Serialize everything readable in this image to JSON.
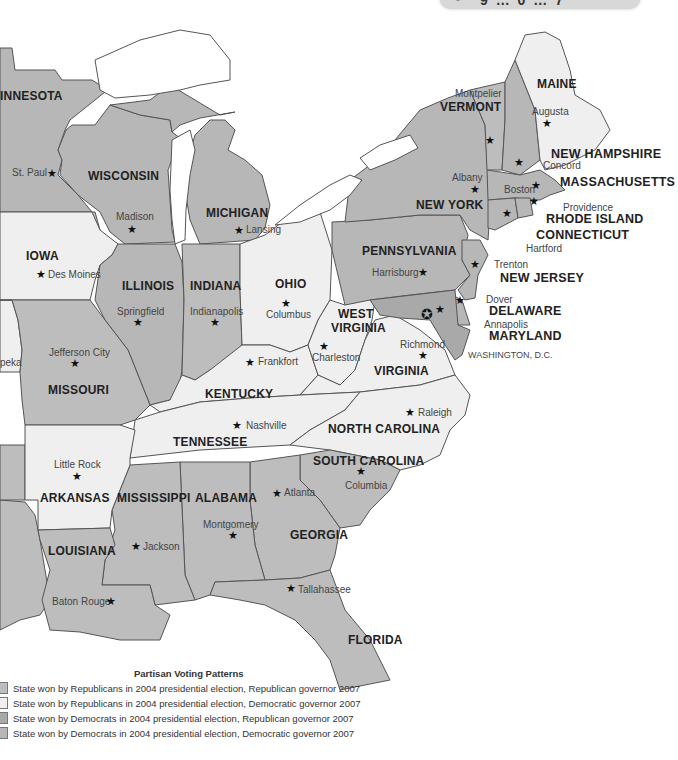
{
  "top_bar": {
    "text": "9 … 0 … 7",
    "icon": "pencil-icon"
  },
  "legend": {
    "title": "Partisan Voting Patterns",
    "items": [
      {
        "key": "rr",
        "color": "#bdbdbd",
        "label": "State won by Republicans in 2004 presidential election, Republican governor 2007"
      },
      {
        "key": "rd",
        "color": "#efefef",
        "label": "State won by Republicans in 2004 presidential election, Democratic governor 2007"
      },
      {
        "key": "dr",
        "color": "#a9a9a9",
        "label": "State won by Democrats in 2004 presidential election, Republican governor 2007"
      },
      {
        "key": "dd",
        "color": "#b7b7b7",
        "label": "State won by Democrats in 2004 presidential election, Democratic governor 2007"
      }
    ]
  },
  "states": {
    "minnesota": {
      "name": "INNESOTA",
      "capital": "St. Paul"
    },
    "wisconsin": {
      "name": "WISCONSIN",
      "capital": "Madison"
    },
    "michigan": {
      "name": "MICHIGAN",
      "capital": "Lansing"
    },
    "iowa": {
      "name": "IOWA",
      "capital": "Des Moines"
    },
    "illinois": {
      "name": "ILLINOIS",
      "capital": "Springfield"
    },
    "indiana": {
      "name": "INDIANA",
      "capital": "Indianapolis"
    },
    "ohio": {
      "name": "OHIO",
      "capital": "Columbus"
    },
    "kansas": {
      "capital": "peka"
    },
    "missouri": {
      "name": "MISSOURI",
      "capital": "Jefferson City"
    },
    "kentucky": {
      "name": "KENTUCKY",
      "capital": "Frankfort"
    },
    "west_virginia": {
      "name_1": "WEST",
      "name_2": "VIRGINIA",
      "capital": "Charleston"
    },
    "virginia": {
      "name": "VIRGINIA",
      "capital": "Richmond"
    },
    "pennsylvania": {
      "name": "PENNSYLVANIA",
      "capital": "Harrisburg"
    },
    "new_york": {
      "name": "NEW YORK",
      "capital": "Albany"
    },
    "vermont": {
      "name": "VERMONT",
      "capital": "Montpelier"
    },
    "maine": {
      "name": "MAINE",
      "capital": "Augusta"
    },
    "new_hampshire": {
      "name": "NEW HAMPSHIRE",
      "capital": "Concord"
    },
    "massachusetts": {
      "name": "MASSACHUSETTS",
      "capital": "Boston"
    },
    "rhode_island": {
      "name": "RHODE ISLAND",
      "capital": "Providence"
    },
    "connecticut": {
      "name": "CONNECTICUT",
      "capital": "Hartford"
    },
    "new_jersey": {
      "name": "NEW JERSEY",
      "capital": "Trenton"
    },
    "delaware": {
      "name": "DELAWARE",
      "capital": "Dover"
    },
    "maryland": {
      "name": "MARYLAND",
      "capital": "Annapolis"
    },
    "dc": {
      "name": "WASHINGTON, D.C."
    },
    "tennessee": {
      "name": "TENNESSEE",
      "capital": "Nashville"
    },
    "north_carolina": {
      "name": "NORTH CAROLINA",
      "capital": "Raleigh"
    },
    "south_carolina": {
      "name": "SOUTH CAROLINA",
      "capital": "Columbia"
    },
    "arkansas": {
      "name": "ARKANSAS",
      "capital": "Little Rock"
    },
    "mississippi": {
      "name": "MISSISSIPPI",
      "capital": "Jackson"
    },
    "alabama": {
      "name": "ALABAMA",
      "capital": "Montgomery"
    },
    "georgia": {
      "name": "GEORGIA",
      "capital": "Atlanta"
    },
    "louisiana": {
      "name": "LOUISIANA",
      "capital": "Baton Rouge"
    },
    "florida": {
      "name": "FLORIDA",
      "capital": "Tallahassee"
    }
  },
  "symbols": {
    "star": "★",
    "dc_star": "✪"
  }
}
